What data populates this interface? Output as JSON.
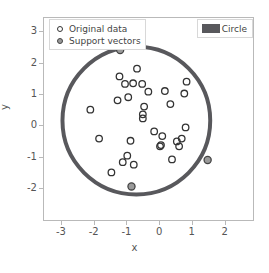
{
  "figure": {
    "background": "#ffffff",
    "axes_color": "#b9b9b9",
    "text_color": "#555555"
  },
  "axis": {
    "xlabel": "x",
    "ylabel": "y",
    "xticks": [
      "-3",
      "-2",
      "-1",
      "0",
      "1",
      "2"
    ],
    "yticks": [
      "3",
      "2",
      "1",
      "0",
      "-1",
      "-2"
    ]
  },
  "legend_main": {
    "items": [
      {
        "label": "Original data",
        "glyph": "open-circle-marker"
      },
      {
        "label": "Support vectors",
        "glyph": "filled-circle-marker"
      }
    ]
  },
  "legend_patch": {
    "items": [
      {
        "label": "Circle",
        "glyph": "filled-rect-swatch",
        "color": "#58585c"
      }
    ]
  },
  "chart_data": {
    "type": "scatter",
    "title": "",
    "xlabel": "x",
    "ylabel": "y",
    "xlim": [
      -3.55,
      2.9
    ],
    "ylim": [
      -3.05,
      3.45
    ],
    "xticks": [
      -3,
      -2,
      -1,
      0,
      1,
      2
    ],
    "yticks": [
      3,
      2,
      1,
      0,
      -1,
      -2
    ],
    "grid": false,
    "legend_position": "upper left / upper right",
    "series": [
      {
        "name": "Original data",
        "marker": "open circle",
        "edgecolor": "#333333",
        "facecolor": "none",
        "points": [
          [
            -2.12,
            0.5
          ],
          [
            -1.85,
            -0.43
          ],
          [
            -1.47,
            -1.52
          ],
          [
            -1.28,
            0.8
          ],
          [
            -1.22,
            1.57
          ],
          [
            -1.12,
            -1.19
          ],
          [
            -1.05,
            1.33
          ],
          [
            -0.98,
            -0.98
          ],
          [
            -0.95,
            0.9
          ],
          [
            -0.88,
            -0.5
          ],
          [
            -0.8,
            1.35
          ],
          [
            -0.78,
            -1.27
          ],
          [
            -0.68,
            1.82
          ],
          [
            -0.52,
            1.33
          ],
          [
            -0.5,
            0.35
          ],
          [
            -0.5,
            0.22
          ],
          [
            -0.46,
            0.6
          ],
          [
            -0.33,
            1.08
          ],
          [
            -0.15,
            -0.2
          ],
          [
            0.03,
            -0.68
          ],
          [
            0.06,
            -0.64
          ],
          [
            0.1,
            -0.35
          ],
          [
            0.18,
            1.1
          ],
          [
            0.35,
            0.68
          ],
          [
            0.4,
            -1.1
          ],
          [
            0.55,
            -0.52
          ],
          [
            0.62,
            -0.68
          ],
          [
            0.7,
            -0.43
          ],
          [
            0.78,
            1.02
          ],
          [
            0.82,
            -0.07
          ],
          [
            0.85,
            1.4
          ]
        ]
      },
      {
        "name": "Support vectors",
        "marker": "filled circle",
        "edgecolor": "#444444",
        "facecolor": "#9a9a9a",
        "points": [
          [
            -1.2,
            2.42
          ],
          [
            1.5,
            -1.12
          ],
          [
            -0.85,
            -1.97
          ]
        ]
      }
    ],
    "patches": [
      {
        "name": "Circle",
        "type": "circle-outline",
        "center": [
          -0.7,
          0.15
        ],
        "radius": 2.28,
        "color": "#58585c",
        "linewidth": 4
      }
    ]
  }
}
